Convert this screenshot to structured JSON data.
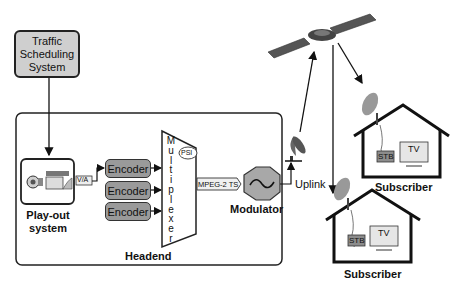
{
  "diagram": {
    "traffic_system": {
      "label": "Traffic Scheduling System",
      "line1": "Traffic",
      "line2": "Scheduling",
      "line3": "System"
    },
    "playout": {
      "line1": "Play-out",
      "line2": "system",
      "signal_label": "V/A"
    },
    "encoders": [
      {
        "label": "Encoder"
      },
      {
        "label": "Encoder"
      },
      {
        "label": "Encoder"
      }
    ],
    "multiplexer": {
      "letters": [
        "M",
        "u",
        "l",
        "t",
        "i",
        "p",
        "l",
        "e",
        "x",
        "e",
        "r"
      ],
      "psi_label": "PSI"
    },
    "stream_label": "MPEG-2 TS",
    "modulator": {
      "label": "Modulator"
    },
    "headend": {
      "label": "Headend"
    },
    "uplink": {
      "label": "Uplink"
    },
    "subscribers": [
      {
        "label": "Subscriber",
        "stb": "STB",
        "tv": "TV"
      },
      {
        "label": "Subscriber",
        "stb": "STB",
        "tv": "TV"
      }
    ],
    "colors": {
      "box_fill": "#cfcfcf",
      "encoder_fill": "#9a9a9a",
      "stroke": "#222222",
      "stb_fill": "#8c8c8c"
    }
  }
}
